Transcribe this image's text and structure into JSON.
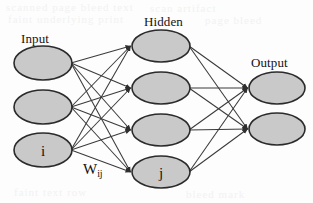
{
  "diagram": {
    "colors": {
      "node_fill": "#c9c9c9",
      "node_stroke": "#2b2b2b",
      "edge": "#3a3a3a",
      "background": "#fdfdfd",
      "text": "#111111"
    },
    "layer_labels": {
      "input": "Input",
      "hidden": "Hidden",
      "output": "Output"
    },
    "weight_label": {
      "base": "W",
      "subscript": "ij"
    },
    "layers": [
      {
        "id": "input",
        "label": "Input",
        "nodes": [
          {
            "id": "input-node-1",
            "label": "",
            "cx": 43,
            "cy": 63,
            "rx": 29,
            "ry": 17
          },
          {
            "id": "input-node-2",
            "label": "",
            "cx": 43,
            "cy": 107,
            "rx": 29,
            "ry": 17
          },
          {
            "id": "input-node-3",
            "label": "i",
            "cx": 43,
            "cy": 150,
            "rx": 29,
            "ry": 17
          }
        ]
      },
      {
        "id": "hidden",
        "label": "Hidden",
        "nodes": [
          {
            "id": "hidden-node-1",
            "label": "",
            "cx": 161,
            "cy": 46,
            "rx": 29,
            "ry": 16
          },
          {
            "id": "hidden-node-2",
            "label": "",
            "cx": 161,
            "cy": 88,
            "rx": 29,
            "ry": 16
          },
          {
            "id": "hidden-node-3",
            "label": "",
            "cx": 161,
            "cy": 130,
            "rx": 29,
            "ry": 16
          },
          {
            "id": "hidden-node-4",
            "label": "j",
            "cx": 161,
            "cy": 172,
            "rx": 29,
            "ry": 16
          }
        ]
      },
      {
        "id": "output",
        "label": "Output",
        "nodes": [
          {
            "id": "output-node-1",
            "label": "",
            "cx": 277,
            "cy": 88,
            "rx": 28,
            "ry": 16
          },
          {
            "id": "output-node-2",
            "label": "",
            "cx": 277,
            "cy": 129,
            "rx": 28,
            "ry": 16
          }
        ]
      }
    ],
    "connections": {
      "input_to_hidden": "fully-connected",
      "hidden_to_output": "fully-connected",
      "arrowhead": "filled-triangle",
      "edge_count_input_hidden": 12,
      "edge_count_hidden_output": 8
    }
  },
  "background_artifacts": {
    "line_1": "scanned page bleed text",
    "line_2": "faint underlying print",
    "line_3": "scan artifact",
    "line_4": "page bleed",
    "line_5": "faint text row",
    "line_6": "bleed mark"
  }
}
